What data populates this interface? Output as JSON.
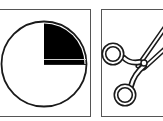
{
  "panels": [
    {
      "id": "left",
      "label": "Quarter circle",
      "icon": "pie-quarter-icon",
      "fill_fraction": 0.25,
      "filled_quadrant": "top-right",
      "colors": {
        "fill": "#000000",
        "outline": "#1a1a1a",
        "background": "#ffffff"
      }
    },
    {
      "id": "right",
      "label": "Scissors",
      "icon": "scissors-icon",
      "colors": {
        "stroke": "#1a1a1a",
        "background": "#ffffff"
      }
    }
  ]
}
